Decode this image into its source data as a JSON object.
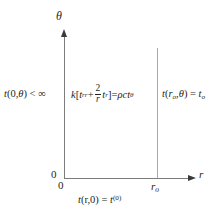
{
  "figure": {
    "type": "math-domain-diagram",
    "background_color": "#ffffff",
    "axis_color": "#7c7c7c",
    "boundary_line_color": "#a8a8a8",
    "text_color": "#231f20"
  },
  "axes": {
    "y_axis": {
      "label": "θ",
      "origin_label": "0",
      "arrow": "up-arrow-icon"
    },
    "x_axis": {
      "label": "r",
      "origin_label": "0",
      "arrow": "right-arrow-icon"
    },
    "ticks": {
      "r_outer": "r",
      "r_outer_sub": "o"
    }
  },
  "boundary_conditions": {
    "left": {
      "t": "t",
      "args": "(0,",
      "theta": "θ",
      "relation": ") < ",
      "infinity": "∞",
      "full_text": "t(0,θ) < ∞"
    },
    "right": {
      "t": "t",
      "open": "(",
      "r": "r",
      "r_sub": "o",
      "comma": ",",
      "theta": "θ",
      "close": ") = ",
      "t_value": "t",
      "t_value_sub": "o",
      "full_text": "t(rₒ,θ) = tₒ"
    },
    "initial": {
      "t": "t",
      "args": "(r,0) = ",
      "t_value": "t",
      "superscript": "(0)",
      "full_text": "t(r,0) = t⁽⁰⁾"
    }
  },
  "governing_equation": {
    "k": "k",
    "bracket_open": "[",
    "t_rr": "t",
    "t_rr_sub": "rr",
    "plus": " + ",
    "fraction_numerator": "2",
    "fraction_denominator": "r",
    "t_r": "t",
    "t_r_sub": "r",
    "bracket_close": "]",
    "equals": " = ",
    "rho": "ρ",
    "c": "c",
    "t_theta": "t",
    "t_theta_sub": "θ",
    "full_text": "k[tᵣᵣ + (2/r)tᵣ] = ρctₒ"
  }
}
